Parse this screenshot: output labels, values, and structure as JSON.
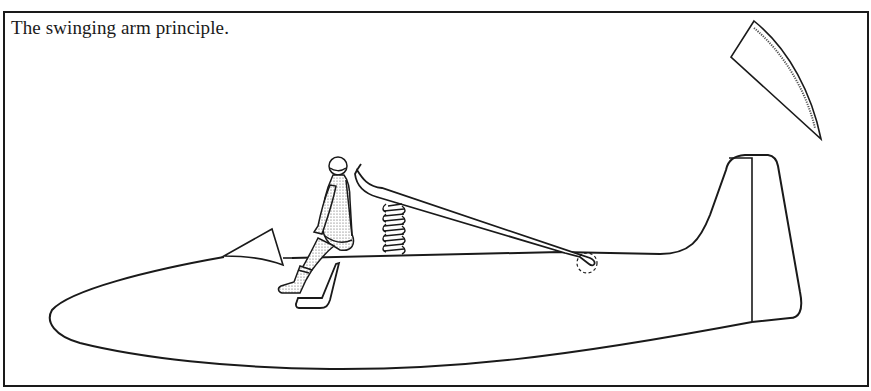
{
  "figure": {
    "caption": "The swinging arm principle.",
    "colors": {
      "ink": "#1a1a1a",
      "background": "#ffffff",
      "stipple": "#555555"
    },
    "elements": [
      {
        "name": "glider-fuselage",
        "description": "Side profile of glider fuselage with nose at left"
      },
      {
        "name": "tail-fin",
        "description": "Vertical tail fin with rudder hinge line"
      },
      {
        "name": "pilot",
        "description": "Pilot in flight suit and helmet being ejected from seat"
      },
      {
        "name": "swinging-arm",
        "description": "Arm pivoting from rear fuselage lifting the pilot"
      },
      {
        "name": "spring",
        "description": "Coil spring pushing the swinging arm upward"
      },
      {
        "name": "pivot-point",
        "description": "Dashed circle marking arm pivot on fuselage"
      },
      {
        "name": "seat",
        "description": "Empty seat pan in cockpit"
      },
      {
        "name": "windscreen",
        "description": "Small triangular windscreen ahead of cockpit"
      },
      {
        "name": "jettisoned-canopy",
        "description": "Canopy flying away at upper right"
      }
    ]
  }
}
